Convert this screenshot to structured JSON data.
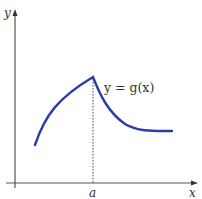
{
  "figure": {
    "axes": {
      "x_label": "x",
      "y_label": "y",
      "axis_color": "#555555"
    },
    "curve": {
      "label": "y = g(x)",
      "color": "#2b3ea8",
      "description": "Increasing concave curve rising to a sharp peak at x = a, then decreasing and leveling off to a horizontal asymptote-like tail"
    },
    "marker": {
      "tick_label": "a",
      "style": "dotted vertical line from peak down to x-axis"
    }
  }
}
